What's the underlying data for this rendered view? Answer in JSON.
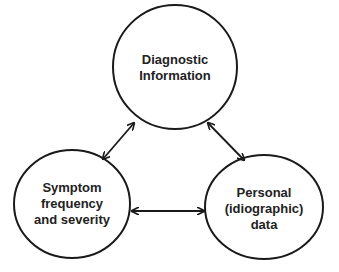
{
  "diagram": {
    "nodes": [
      {
        "id": "diagnostic",
        "lines": [
          "Diagnostic",
          "Information"
        ]
      },
      {
        "id": "symptom",
        "lines": [
          "Symptom",
          "frequency",
          "and severity"
        ]
      },
      {
        "id": "personal",
        "lines": [
          "Personal",
          "(idiographic)",
          "data"
        ]
      }
    ],
    "edges": [
      {
        "from": "diagnostic",
        "to": "symptom",
        "type": "bidirectional"
      },
      {
        "from": "diagnostic",
        "to": "personal",
        "type": "bidirectional"
      },
      {
        "from": "symptom",
        "to": "personal",
        "type": "bidirectional"
      }
    ],
    "colors": {
      "stroke": "#1a1a1a",
      "text": "#222222",
      "background": "#ffffff"
    }
  }
}
